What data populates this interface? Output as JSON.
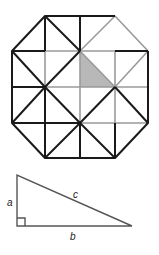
{
  "figure": {
    "octagon_grid": {
      "description": "Octagon on a 4x4 square grid with diagonals; one small right triangle shaded",
      "grid_x": [
        12,
        45,
        80,
        115,
        148
      ],
      "grid_y": [
        16,
        51,
        87,
        123,
        158
      ],
      "colors": {
        "black": "#1a1a1a",
        "gray": "#9a9a9a",
        "shade": "#b8b8b8"
      }
    },
    "triangle": {
      "labels": {
        "a": "a",
        "b": "b",
        "c": "c"
      },
      "right_angle_marker": true
    }
  }
}
